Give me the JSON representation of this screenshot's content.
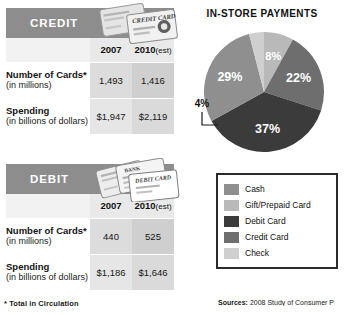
{
  "left": {
    "footnote": "* Total in Circulation",
    "tables": [
      {
        "title": "CREDIT",
        "art": "credit-card-illustration",
        "year_headers": [
          "2007",
          "2010"
        ],
        "est_suffix": "(est)",
        "rows": [
          {
            "label_main": "Number of Cards*",
            "label_sub": "(in millions)",
            "values": [
              "1,493",
              "1,416"
            ]
          },
          {
            "label_main": "Spending",
            "label_sub": "(in billions of dollars)",
            "values": [
              "$1,947",
              "$2,119"
            ]
          }
        ]
      },
      {
        "title": "DEBIT",
        "art": "debit-card-illustration",
        "year_headers": [
          "2007",
          "2010"
        ],
        "est_suffix": "(est)",
        "rows": [
          {
            "label_main": "Number of Cards*",
            "label_sub": "(in millions)",
            "values": [
              "440",
              "525"
            ]
          },
          {
            "label_main": "Spending",
            "label_sub": "(in billions of dollars)",
            "values": [
              "$1,186",
              "$1,646"
            ]
          }
        ]
      }
    ]
  },
  "right": {
    "title": "IN-STORE PAYMENTS",
    "sources_lead": "Sources:",
    "sources_text": "2008 Study of Consumer P"
  },
  "chart_data": {
    "type": "pie",
    "title": "IN-STORE PAYMENTS",
    "categories": [
      "Cash",
      "Gift/Prepaid Card",
      "Debit Card",
      "Credit Card",
      "Check"
    ],
    "values": [
      29,
      8,
      37,
      22,
      4
    ],
    "labels": [
      "29%",
      "8%",
      "37%",
      "22%",
      "4%"
    ],
    "colors": [
      "#8f8f8f",
      "#b9b9b9",
      "#3b3b3b",
      "#6e6e6e",
      "#cfcfcf"
    ],
    "legend_position": "below",
    "units": "percent"
  }
}
